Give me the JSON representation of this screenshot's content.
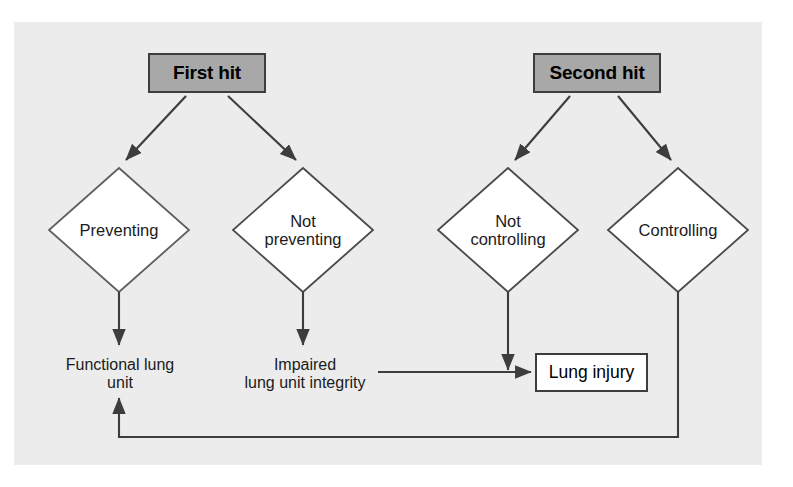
{
  "figure": {
    "type": "flowchart",
    "background_color": "#ececec",
    "page_background": "#ffffff"
  },
  "nodes": {
    "first_hit": {
      "label": "First hit",
      "shape": "rectangle",
      "fill": "#a8a8a8",
      "stroke": "#3d3d3d"
    },
    "second_hit": {
      "label": "Second hit",
      "shape": "rectangle",
      "fill": "#a8a8a8",
      "stroke": "#3d3d3d"
    },
    "preventing": {
      "label": "Preventing",
      "shape": "diamond",
      "fill": "#ffffff",
      "stroke": "#6e6e6e"
    },
    "not_preventing": {
      "label": "Not\npreventing",
      "shape": "diamond",
      "fill": "#ffffff",
      "stroke": "#3d3d3d"
    },
    "not_controlling": {
      "label": "Not\ncontrolling",
      "shape": "diamond",
      "fill": "#ffffff",
      "stroke": "#3d3d3d"
    },
    "controlling": {
      "label": "Controlling",
      "shape": "diamond",
      "fill": "#ffffff",
      "stroke": "#3d3d3d"
    },
    "functional_lung_unit": {
      "label": "Functional lung\nunit",
      "shape": "text",
      "fill": "none"
    },
    "impaired_lung_unit": {
      "label": "Impaired\nlung unit integrity",
      "shape": "text",
      "fill": "none"
    },
    "lung_injury": {
      "label": "Lung injury",
      "shape": "rectangle",
      "fill": "#ffffff",
      "stroke": "#3d3d3d"
    }
  },
  "edges": [
    {
      "name": "first-hit-to-preventing",
      "from": "first_hit",
      "to": "preventing",
      "arrowhead": true
    },
    {
      "name": "first-hit-to-not-preventing",
      "from": "first_hit",
      "to": "not_preventing",
      "arrowhead": true
    },
    {
      "name": "second-hit-to-not-controlling",
      "from": "second_hit",
      "to": "not_controlling",
      "arrowhead": true
    },
    {
      "name": "second-hit-to-controlling",
      "from": "second_hit",
      "to": "controlling",
      "arrowhead": true
    },
    {
      "name": "preventing-to-functional-lung-unit",
      "from": "preventing",
      "to": "functional_lung_unit",
      "arrowhead": true
    },
    {
      "name": "not-preventing-to-impaired-lung-unit",
      "from": "not_preventing",
      "to": "impaired_lung_unit",
      "arrowhead": true
    },
    {
      "name": "impaired-lung-unit-to-lung-injury",
      "from": "impaired_lung_unit",
      "to": "lung_injury",
      "arrowhead": true
    },
    {
      "name": "not-controlling-to-lung-injury-path",
      "from": "not_controlling",
      "to": "lung_injury",
      "arrowhead": true
    },
    {
      "name": "controlling-to-functional-lung-unit-feedback",
      "from": "controlling",
      "to": "functional_lung_unit",
      "arrowhead": true
    }
  ],
  "colors": {
    "line": "#3d3d3d",
    "diamond_stroke": "#5a5a5a",
    "text": "#1b1b1b",
    "box_fill_gray": "#a8a8a8",
    "box_fill_white": "#ffffff"
  }
}
